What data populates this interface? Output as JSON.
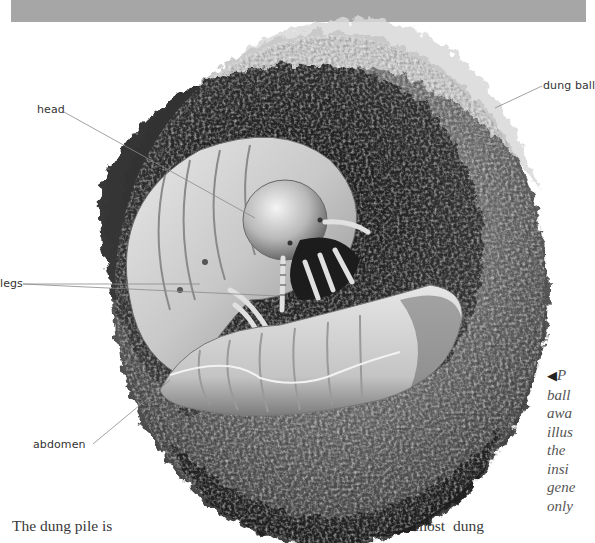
{
  "page": {
    "top_bar_color": "#a6a6a6"
  },
  "illustration": {
    "subject": "dung beetle larva inside dung ball",
    "labels": {
      "head": "head",
      "dung_ball": "dung ball",
      "legs": "legs",
      "abdomen": "abdomen"
    }
  },
  "caption": {
    "arrow_icon": "◀",
    "lines": [
      "P",
      "ball",
      "awa",
      "illus",
      "the",
      "insi",
      "gene",
      "only"
    ]
  },
  "body_text": {
    "left_fragment": "The dung pile is",
    "right_fragment": "most  dung"
  }
}
